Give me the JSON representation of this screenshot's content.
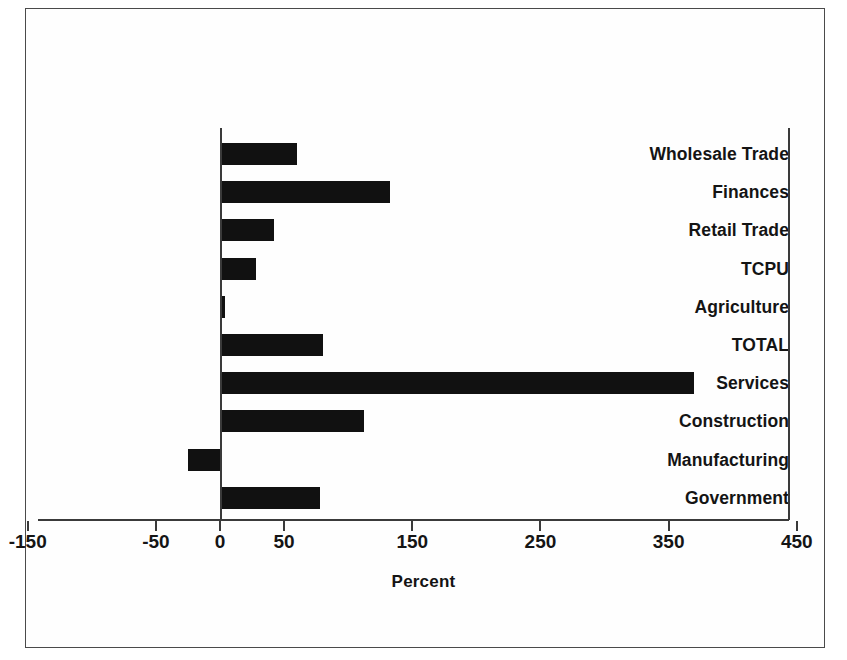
{
  "chart_data": {
    "type": "bar",
    "orientation": "horizontal",
    "title": "",
    "xlabel": "Percent",
    "ylabel": "",
    "xlim": [
      -150,
      450
    ],
    "xticks": [
      -150,
      -50,
      50,
      150,
      250,
      350,
      450
    ],
    "xticklabels": [
      "-150",
      "-50",
      "0",
      "50",
      "150",
      "250",
      "350",
      "450"
    ],
    "grid": false,
    "legend": false,
    "bar_color": "#111111",
    "categories": [
      "Wholesale Trade",
      "Finances",
      "Retail Trade",
      "TCPU",
      "Agriculture",
      "TOTAL",
      "Services",
      "Construction",
      "Manufacturing",
      "Government"
    ],
    "values": [
      60,
      133,
      42,
      28,
      4,
      80,
      370,
      112,
      -25,
      78
    ]
  },
  "axis": {
    "ticks": [
      {
        "value": -150,
        "label": "-150"
      },
      {
        "value": -50,
        "label": "-50"
      },
      {
        "value": 0,
        "label": "0"
      },
      {
        "value": 50,
        "label": "50"
      },
      {
        "value": 150,
        "label": "150"
      },
      {
        "value": 250,
        "label": "250"
      },
      {
        "value": 350,
        "label": "350"
      },
      {
        "value": 450,
        "label": "450"
      }
    ],
    "title": "Percent"
  }
}
